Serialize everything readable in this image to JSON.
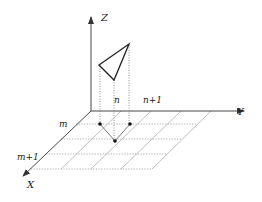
{
  "figure": {
    "axes": {
      "x_label": "X",
      "y_label": "Y",
      "z_label": "Z"
    },
    "grid_labels": {
      "row_m": "m",
      "row_m1": "m+1",
      "col_n": "n",
      "col_n1": "n+1"
    },
    "colors": {
      "line": "#333333",
      "grid": "#9a9a9a",
      "background": "#ffffff"
    }
  }
}
